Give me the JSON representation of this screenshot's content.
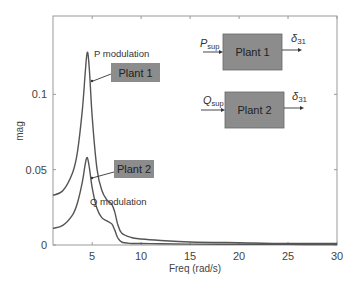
{
  "chart_data": {
    "type": "line",
    "title": "",
    "xlabel": "Freq (rad/s)",
    "ylabel": "mag",
    "xlim": [
      1,
      30
    ],
    "ylim": [
      0,
      0.152
    ],
    "xticks": [
      5,
      10,
      15,
      20,
      25,
      30
    ],
    "yticks": [
      0,
      0.05,
      0.1
    ],
    "xtick_labels": [
      "5",
      "10",
      "15",
      "20",
      "25",
      "30"
    ],
    "ytick_labels": [
      "0",
      "0.05",
      "0.1"
    ],
    "grid": false,
    "legend": null,
    "series": [
      {
        "name": "P modulation (Plant 1)",
        "x": [
          1,
          2,
          3,
          3.5,
          4,
          4.3,
          4.5,
          4.7,
          5,
          5.5,
          6,
          6.5,
          7,
          7.3,
          7.6,
          8,
          9,
          10,
          12,
          15,
          20,
          25,
          30
        ],
        "y": [
          0.033,
          0.036,
          0.048,
          0.062,
          0.09,
          0.115,
          0.128,
          0.118,
          0.085,
          0.05,
          0.036,
          0.03,
          0.027,
          0.022,
          0.014,
          0.008,
          0.005,
          0.004,
          0.003,
          0.002,
          0.0015,
          0.001,
          0.001
        ]
      },
      {
        "name": "Q modulation (Plant 2)",
        "x": [
          1,
          2,
          3,
          3.5,
          4,
          4.3,
          4.5,
          4.7,
          5,
          5.5,
          6,
          6.5,
          7,
          7.3,
          7.6,
          8,
          9,
          10,
          12,
          15,
          20,
          25,
          30
        ],
        "y": [
          0.011,
          0.013,
          0.02,
          0.028,
          0.042,
          0.054,
          0.058,
          0.052,
          0.038,
          0.024,
          0.018,
          0.016,
          0.014,
          0.01,
          0.005,
          0.002,
          0.001,
          0.001,
          0.0008,
          0.0006,
          0.0005,
          0.0004,
          0.0003
        ]
      }
    ],
    "annotations": [
      {
        "text": "P modulation",
        "x": 5.3,
        "y": 0.125
      },
      {
        "text": "Q modulation",
        "x": 5.2,
        "y": 0.03
      },
      {
        "text": "Plant 1",
        "box": true,
        "arrow_to": [
          4.8,
          0.102
        ]
      },
      {
        "text": "Plant 2",
        "box": true,
        "arrow_to": [
          4.6,
          0.043
        ]
      }
    ],
    "inset_diagram": {
      "blocks": [
        {
          "label": "Plant 1",
          "input": "P_sup",
          "output": "δ31"
        },
        {
          "label": "Plant 2",
          "input": "Q_sup",
          "output": "δ31"
        }
      ]
    }
  },
  "labels": {
    "xlabel": "Freq (rad/s)",
    "ylabel": "mag",
    "p_mod": "P modulation",
    "q_mod": "Q modulation",
    "plant1": "Plant 1",
    "plant2": "Plant 2",
    "p_in_main": "P",
    "p_in_sub": "sup",
    "q_in_main": "Q",
    "q_in_sub": "sup",
    "delta": "δ",
    "delta_sub": "31"
  },
  "colors": {
    "line": "#555555",
    "box_fill": "#8c8c8c",
    "axis": "#999999"
  }
}
